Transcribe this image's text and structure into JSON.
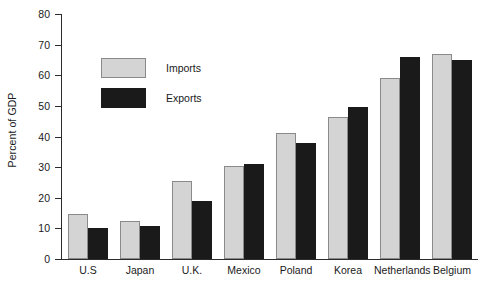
{
  "chart_data": {
    "type": "bar",
    "title": "",
    "xlabel": "",
    "ylabel": "Percent of GDP",
    "ylim": [
      0,
      80
    ],
    "yticks": [
      0,
      10,
      20,
      30,
      40,
      50,
      60,
      70,
      80
    ],
    "ytick_labels": [
      "0",
      "10",
      "20",
      "30",
      "40",
      "50",
      "60",
      "70",
      "80"
    ],
    "grid": false,
    "legend_position": "upper-left-inside",
    "categories": [
      "U.S",
      "Japan",
      "U.K.",
      "Mexico",
      "Poland",
      "Korea",
      "Netherlands",
      "Belgium"
    ],
    "series": [
      {
        "name": "Imports",
        "color": "#d4d4d4",
        "values": [
          14.7,
          12.5,
          25.6,
          30.4,
          41.0,
          46.5,
          59.0,
          67.0
        ]
      },
      {
        "name": "Exports",
        "color": "#1a1a1a",
        "values": [
          10.0,
          10.8,
          19.0,
          30.9,
          38.0,
          49.5,
          66.0,
          65.0
        ]
      }
    ]
  },
  "legend": {
    "items": [
      {
        "label": "Imports",
        "swatch": "imports-swatch"
      },
      {
        "label": "Exports",
        "swatch": "exports-swatch"
      }
    ]
  }
}
